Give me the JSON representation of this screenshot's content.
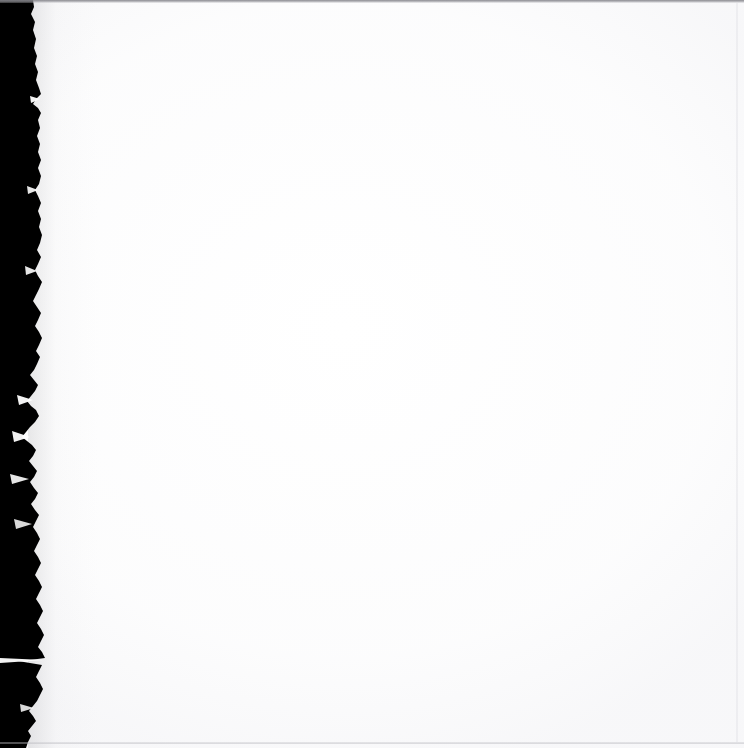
{
  "document": {
    "kind": "scanned-page",
    "page_content_text": "",
    "is_blank": "true",
    "width_px": 744,
    "height_px": 748
  },
  "colors": {
    "page_background": "#ffffff",
    "gutter_black": "#000000",
    "scan_line_gray": "#84848a",
    "bottom_line_gray": "#b0b0b6",
    "right_edge_gray": "#e0e0e5",
    "paper_tone": "#f6f6f8"
  },
  "regions": {
    "gutter": {
      "name": "scanner-gutter",
      "description": "black binding shadow along left side",
      "x": 0,
      "y": 0,
      "width": 44,
      "height": 748
    },
    "torn_edge": {
      "name": "torn-paper-edge",
      "description": "ragged deckle edge between gutter and page",
      "min_x": 22,
      "max_x": 46
    },
    "paper": {
      "name": "page-surface",
      "description": "blank white scanned page area",
      "x": 44,
      "y": 0,
      "width": 700,
      "height": 748
    }
  },
  "edges": {
    "top_line_label": "",
    "bottom_line_label": "",
    "right_line_label": ""
  },
  "gutter_path": "M 0,0 L 33,0 L 34,7 L 31,14 L 35,22 L 33,30 L 36,39 L 34,48 L 37,56 L 35,64 L 38,72 L 36,80 L 39,88 L 41,94 L 36,99 L 33,104 L 38,108 L 41,113 L 38,120 L 40,128 L 37,136 L 40,144 L 38,152 L 41,160 L 38,168 L 41,176 L 39,184 L 35,190 L 38,196 L 41,203 L 38,211 L 41,219 L 39,227 L 42,235 L 40,243 L 37,250 L 41,257 L 38,264 L 35,270 L 38,276 L 42,282 L 39,289 L 36,295 L 33,301 L 37,307 L 41,313 L 38,320 L 35,326 L 39,332 L 42,338 L 39,345 L 36,351 L 40,357 L 37,364 L 34,370 L 30,375 L 34,380 L 38,385 L 35,391 L 31,396 L 27,401 L 31,406 L 36,410 L 39,416 L 35,422 L 30,427 L 26,432 L 22,437 L 27,441 L 32,445 L 36,450 L 33,456 L 29,461 L 33,466 L 37,471 L 34,477 L 30,482 L 34,488 L 38,493 L 35,499 L 31,504 L 35,510 L 39,515 L 36,521 L 33,527 L 37,533 L 40,539 L 37,545 L 34,551 L 38,557 L 41,563 L 38,569 L 35,575 L 39,581 L 42,587 L 39,593 L 36,599 L 40,605 L 43,611 L 40,617 L 37,623 L 41,629 L 44,635 L 41,641 L 38,647 L 42,652 L 45,658 L 30,660 L 18,661 L 30,663 L 42,665 L 39,671 L 36,677 L 40,683 L 43,689 L 40,695 L 37,701 L 33,706 L 29,711 L 33,716 L 36,721 L 32,726 L 28,731 L 31,736 L 28,742 L 26,748 L 0,748 Z"
}
